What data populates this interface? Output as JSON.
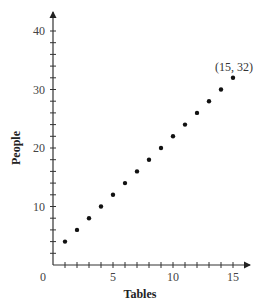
{
  "chart_data": {
    "type": "scatter",
    "title": "",
    "xlabel": "Tables",
    "ylabel": "People",
    "xlim": [
      0,
      16
    ],
    "ylim": [
      0,
      43
    ],
    "x_ticks_major": [
      0,
      5,
      10,
      15
    ],
    "x_tick_labels": [
      "0",
      "5",
      "10",
      "15"
    ],
    "x_minor_step": 1,
    "y_ticks_major": [
      10,
      20,
      30,
      40
    ],
    "y_tick_labels": [
      "10",
      "20",
      "30",
      "40"
    ],
    "y_minor_step": 2,
    "grid": false,
    "legend": null,
    "series": [
      {
        "name": "People vs Tables",
        "x": [
          1,
          2,
          3,
          4,
          5,
          6,
          7,
          8,
          9,
          10,
          11,
          12,
          13,
          14,
          15
        ],
        "y": [
          4,
          6,
          8,
          10,
          12,
          14,
          16,
          18,
          20,
          22,
          24,
          26,
          28,
          30,
          32
        ]
      }
    ],
    "annotations": [
      {
        "text": "(15, 32)",
        "x": 15,
        "y": 32
      }
    ],
    "colors": {
      "axis": "#333333",
      "points": "#111111",
      "text": "#444444"
    }
  }
}
